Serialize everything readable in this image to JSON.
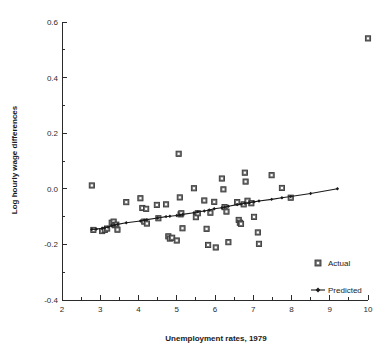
{
  "chart_data": {
    "type": "scatter",
    "title": "",
    "xlabel": "Unemployment rates, 1979",
    "ylabel": "Log hourly wage differences",
    "xlim": [
      2,
      10
    ],
    "ylim": [
      -0.4,
      0.6
    ],
    "xticks": [
      2,
      3,
      4,
      5,
      6,
      7,
      8,
      9,
      10
    ],
    "xtick_labels": [
      "2",
      "3",
      "4",
      "5",
      "6",
      "7",
      "8",
      "9",
      "10"
    ],
    "xtick_minor_step": 0.5,
    "yticks": [
      -0.4,
      -0.2,
      0.0,
      0.2,
      0.4,
      0.6
    ],
    "ytick_labels": [
      "-0.4",
      "-0.2",
      "0.0",
      "0.2",
      "0.4",
      "0.6"
    ],
    "ytick_minor_step": 0.1,
    "grid": false,
    "legend_position": "bottom-right",
    "series": [
      {
        "name": "Actual",
        "marker": "square",
        "type": "scatter",
        "color": "#6e6e6e",
        "points": [
          [
            2.78,
            0.012
          ],
          [
            2.82,
            -0.148
          ],
          [
            3.05,
            -0.152
          ],
          [
            3.12,
            -0.148
          ],
          [
            3.18,
            -0.143
          ],
          [
            3.3,
            -0.122
          ],
          [
            3.35,
            -0.118
          ],
          [
            3.38,
            -0.131
          ],
          [
            3.42,
            -0.129
          ],
          [
            3.45,
            -0.147
          ],
          [
            3.68,
            -0.048
          ],
          [
            4.05,
            -0.034
          ],
          [
            4.1,
            -0.069
          ],
          [
            4.15,
            -0.118
          ],
          [
            4.2,
            -0.072
          ],
          [
            4.22,
            -0.125
          ],
          [
            4.48,
            -0.058
          ],
          [
            4.52,
            -0.106
          ],
          [
            4.72,
            -0.056
          ],
          [
            4.78,
            -0.171
          ],
          [
            4.82,
            -0.179
          ],
          [
            4.88,
            -0.176
          ],
          [
            5.0,
            -0.186
          ],
          [
            5.05,
            0.126
          ],
          [
            5.08,
            -0.031
          ],
          [
            5.1,
            -0.092
          ],
          [
            5.12,
            -0.088
          ],
          [
            5.15,
            -0.142
          ],
          [
            5.45,
            0.002
          ],
          [
            5.5,
            -0.102
          ],
          [
            5.55,
            -0.088
          ],
          [
            5.72,
            -0.042
          ],
          [
            5.78,
            -0.144
          ],
          [
            5.82,
            -0.202
          ],
          [
            5.88,
            -0.086
          ],
          [
            5.98,
            -0.047
          ],
          [
            6.02,
            -0.211
          ],
          [
            6.18,
            0.037
          ],
          [
            6.22,
            -0.002
          ],
          [
            6.25,
            -0.066
          ],
          [
            6.3,
            -0.082
          ],
          [
            6.35,
            -0.192
          ],
          [
            6.58,
            -0.048
          ],
          [
            6.62,
            -0.112
          ],
          [
            6.65,
            -0.122
          ],
          [
            6.68,
            -0.126
          ],
          [
            6.75,
            -0.056
          ],
          [
            6.78,
            0.058
          ],
          [
            6.8,
            0.026
          ],
          [
            6.85,
            -0.043
          ],
          [
            6.95,
            -0.052
          ],
          [
            7.02,
            -0.101
          ],
          [
            7.12,
            -0.157
          ],
          [
            7.15,
            -0.198
          ],
          [
            7.48,
            0.049
          ],
          [
            7.75,
            0.003
          ],
          [
            7.98,
            -0.032
          ],
          [
            10.0,
            0.541
          ]
        ]
      },
      {
        "name": "Predicted",
        "marker": "diamond",
        "type": "line",
        "color": "#1a1a1a",
        "points": [
          [
            2.78,
            -0.146
          ],
          [
            2.9,
            -0.145
          ],
          [
            3.05,
            -0.142
          ],
          [
            3.12,
            -0.14
          ],
          [
            3.2,
            -0.138
          ],
          [
            3.3,
            -0.133
          ],
          [
            3.38,
            -0.13
          ],
          [
            3.45,
            -0.128
          ],
          [
            3.68,
            -0.122
          ],
          [
            4.05,
            -0.116
          ],
          [
            4.15,
            -0.113
          ],
          [
            4.22,
            -0.111
          ],
          [
            4.5,
            -0.105
          ],
          [
            4.72,
            -0.1
          ],
          [
            4.82,
            -0.099
          ],
          [
            5.0,
            -0.096
          ],
          [
            5.08,
            -0.094
          ],
          [
            5.15,
            -0.092
          ],
          [
            5.45,
            -0.086
          ],
          [
            5.55,
            -0.083
          ],
          [
            5.72,
            -0.08
          ],
          [
            5.85,
            -0.076
          ],
          [
            5.98,
            -0.072
          ],
          [
            6.18,
            -0.068
          ],
          [
            6.25,
            -0.066
          ],
          [
            6.35,
            -0.063
          ],
          [
            6.58,
            -0.057
          ],
          [
            6.68,
            -0.055
          ],
          [
            6.78,
            -0.052
          ],
          [
            6.9,
            -0.05
          ],
          [
            7.02,
            -0.047
          ],
          [
            7.15,
            -0.044
          ],
          [
            7.48,
            -0.038
          ],
          [
            7.75,
            -0.032
          ],
          [
            7.98,
            -0.028
          ],
          [
            8.5,
            -0.017
          ],
          [
            9.2,
            0.0
          ]
        ]
      }
    ]
  },
  "legend": {
    "items": [
      {
        "label": "Actual",
        "marker": "square"
      },
      {
        "label": "Predicted",
        "marker": "line-diamond"
      }
    ]
  },
  "colors": {
    "actual_marker_fill": "#6e6e6e",
    "actual_marker_stroke": "#3a3a3a",
    "predicted_line": "#1a1a1a",
    "axis": "#2b2b2b",
    "background": "#ffffff"
  }
}
